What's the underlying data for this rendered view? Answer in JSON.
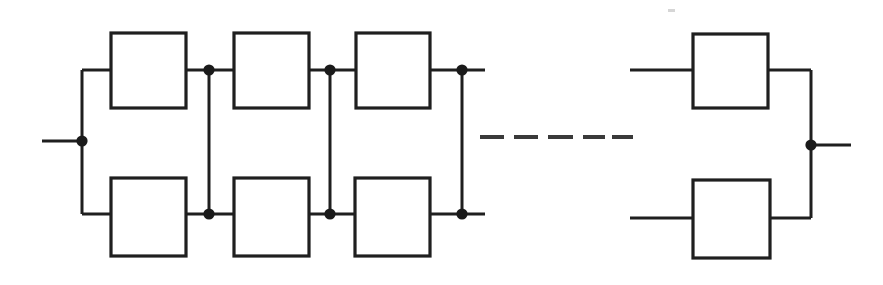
{
  "diagram": {
    "type": "block-diagram",
    "canvas": {
      "width": 883,
      "height": 285,
      "background": "#ffffff"
    },
    "style": {
      "line_color": "#1f1f1f",
      "block_stroke_color": "#1f1f1f",
      "block_fill_color": "#ffffff",
      "node_color": "#1a1a1a",
      "line_width": 3,
      "block_stroke_width": 3.2,
      "node_radius": 5.6,
      "dash_color": "#3a3a3a",
      "dash_width": 4
    },
    "geometry": {
      "top_rail_y": 70,
      "bottom_rail_y": 214,
      "mid_y": 141,
      "left_bus_x": 82,
      "right_bus_x": 811,
      "input_stub_x": 42,
      "output_stub_x": 851,
      "top_box_top": 33,
      "top_box_bottom": 108,
      "bottom_box_top": 178,
      "bottom_box_bottom": 256,
      "right_top_box_top": 34,
      "right_top_box_bottom": 108,
      "right_bottom_box_top": 180,
      "right_bottom_box_bottom": 258,
      "right_top_rail_y": 70,
      "right_bottom_rail_y": 218,
      "right_mid_y": 145
    },
    "blocks": [
      {
        "id": "b-t1",
        "row": "top",
        "column": 1,
        "x": 111,
        "y": 33,
        "w": 75,
        "h": 75,
        "label": ""
      },
      {
        "id": "b-t2",
        "row": "top",
        "column": 2,
        "x": 234,
        "y": 33,
        "w": 75,
        "h": 75,
        "label": ""
      },
      {
        "id": "b-t3",
        "row": "top",
        "column": 3,
        "x": 356,
        "y": 33,
        "w": 74,
        "h": 75,
        "label": ""
      },
      {
        "id": "b-b1",
        "row": "bottom",
        "column": 1,
        "x": 111,
        "y": 178,
        "w": 75,
        "h": 78,
        "label": ""
      },
      {
        "id": "b-b2",
        "row": "bottom",
        "column": 2,
        "x": 234,
        "y": 178,
        "w": 75,
        "h": 78,
        "label": ""
      },
      {
        "id": "b-b3",
        "row": "bottom",
        "column": 3,
        "x": 355,
        "y": 178,
        "w": 75,
        "h": 78,
        "label": ""
      },
      {
        "id": "b-tn",
        "row": "top",
        "column": "n",
        "x": 693,
        "y": 34,
        "w": 75,
        "h": 74,
        "label": ""
      },
      {
        "id": "b-bn",
        "row": "bottom",
        "column": "n",
        "x": 693,
        "y": 180,
        "w": 77,
        "h": 78,
        "label": ""
      }
    ],
    "nodes": [
      {
        "id": "n-input",
        "x": 82,
        "y": 141,
        "role": "input-terminal"
      },
      {
        "id": "n-t1",
        "x": 209,
        "y": 70,
        "role": "junction"
      },
      {
        "id": "n-t2",
        "x": 330,
        "y": 70,
        "role": "junction"
      },
      {
        "id": "n-t3",
        "x": 462,
        "y": 70,
        "role": "junction"
      },
      {
        "id": "n-b1",
        "x": 209,
        "y": 214,
        "role": "junction"
      },
      {
        "id": "n-b2",
        "x": 330,
        "y": 214,
        "role": "junction"
      },
      {
        "id": "n-b3",
        "x": 462,
        "y": 214,
        "role": "junction"
      },
      {
        "id": "n-output",
        "x": 811,
        "y": 145,
        "role": "output-terminal"
      }
    ],
    "cross_links": [
      {
        "id": "x1",
        "x": 209,
        "y1": 70,
        "y2": 214
      },
      {
        "id": "x2",
        "x": 330,
        "y1": 70,
        "y2": 214
      },
      {
        "id": "x3",
        "x": 462,
        "y1": 70,
        "y2": 214
      }
    ],
    "dashed_continuation": {
      "y": 137,
      "x_start": 480,
      "x_end": 620,
      "segments": [
        {
          "x1": 480,
          "x2": 504
        },
        {
          "x1": 514,
          "x2": 538
        },
        {
          "x1": 548,
          "x2": 573
        },
        {
          "x1": 583,
          "x2": 605
        },
        {
          "x1": 612,
          "x2": 633
        }
      ]
    },
    "terminals": {
      "input_label": "",
      "output_label": ""
    },
    "artifacts": [
      {
        "id": "scan-speck",
        "x": 668,
        "y": 9,
        "w": 7,
        "h": 3
      }
    ]
  }
}
